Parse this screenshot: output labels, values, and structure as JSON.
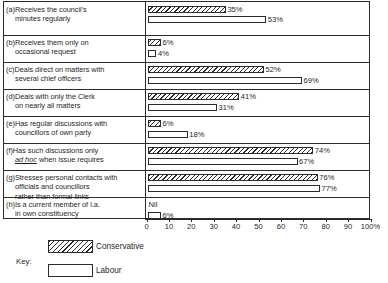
{
  "chart_data": {
    "type": "bar",
    "orientation": "horizontal",
    "title": "",
    "xlabel": "",
    "ylabel": "",
    "xlim": [
      0,
      100
    ],
    "grid": false,
    "legend_position": "bottom-left",
    "legend_title": "Key:",
    "axis_ticks": [
      {
        "value": 0,
        "label": "0"
      },
      {
        "value": 10,
        "label": "10"
      },
      {
        "value": 20,
        "label": "20"
      },
      {
        "value": 30,
        "label": "30"
      },
      {
        "value": 40,
        "label": "40"
      },
      {
        "value": 50,
        "label": "50"
      },
      {
        "value": 60,
        "label": "60"
      },
      {
        "value": 70,
        "label": "70"
      },
      {
        "value": 80,
        "label": "80"
      },
      {
        "value": 90,
        "label": "90"
      },
      {
        "value": 100,
        "label": "100%"
      }
    ],
    "series": [
      {
        "name": "Conservative",
        "pattern": "hatched",
        "values": [
          35,
          6,
          52,
          41,
          6,
          74,
          76,
          null
        ]
      },
      {
        "name": "Labour",
        "pattern": "open",
        "values": [
          53,
          4,
          69,
          31,
          18,
          67,
          77,
          6
        ]
      }
    ],
    "categories": [
      {
        "key": "a",
        "lines": [
          "(a)Receives the council's",
          "minutes regularly"
        ]
      },
      {
        "key": "b",
        "lines": [
          "(b)Receives them only on",
          "occasional request"
        ]
      },
      {
        "key": "c",
        "lines": [
          "(c)Deals direct on matters with",
          "several chief officers"
        ]
      },
      {
        "key": "d",
        "lines": [
          "(d)Deals with only the Clerk",
          "on nearly all matters"
        ]
      },
      {
        "key": "e",
        "lines": [
          "(e)Has regular discussions with",
          "councillors of own party"
        ]
      },
      {
        "key": "f",
        "lines": [
          "(f)Has such discussions only",
          "ad hoc when issue requires"
        ]
      },
      {
        "key": "g",
        "lines": [
          "(g)Stresses personal contacts with",
          "officials and councillors",
          "rather than formal links"
        ]
      },
      {
        "key": "h",
        "lines": [
          "(h)Is a current member of l.a.",
          "in own constituency"
        ]
      }
    ],
    "data_labels": {
      "conservative": [
        "35%",
        "6%",
        "52%",
        "41%",
        "6%",
        "74%",
        "76%",
        "Nil"
      ],
      "labour": [
        "53%",
        "4%",
        "69%",
        "31%",
        "18%",
        "67%",
        "77%",
        "6%"
      ]
    }
  },
  "rows": [
    {
      "label_lines": [
        "(a)Receives the council's",
        "minutes regularly"
      ],
      "con": {
        "value": 35,
        "label": "35%"
      },
      "lab": {
        "value": 53,
        "label": "53%"
      }
    },
    {
      "label_lines": [
        "(b)Receives them only on",
        "occasional request"
      ],
      "con": {
        "value": 6,
        "label": "6%"
      },
      "lab": {
        "value": 4,
        "label": "4%"
      }
    },
    {
      "label_lines": [
        "(c)Deals direct on matters with",
        "several chief officers"
      ],
      "con": {
        "value": 52,
        "label": "52%"
      },
      "lab": {
        "value": 69,
        "label": "69%"
      }
    },
    {
      "label_lines": [
        "(d)Deals with only the Clerk",
        "on nearly all matters"
      ],
      "con": {
        "value": 41,
        "label": "41%"
      },
      "lab": {
        "value": 31,
        "label": "31%"
      }
    },
    {
      "label_lines": [
        "(e)Has regular discussions with",
        "councillors of own party"
      ],
      "con": {
        "value": 6,
        "label": "6%"
      },
      "lab": {
        "value": 18,
        "label": "18%"
      }
    },
    {
      "label_lines": [
        "(f)Has such discussions only",
        "ad hoc when issue requires"
      ],
      "con": {
        "value": 74,
        "label": "74%"
      },
      "lab": {
        "value": 67,
        "label": "67%"
      }
    },
    {
      "label_lines": [
        "(g)Stresses personal contacts with",
        "officials and councillors",
        "rather than formal links"
      ],
      "con": {
        "value": 76,
        "label": "76%"
      },
      "lab": {
        "value": 77,
        "label": "77%"
      }
    },
    {
      "label_lines": [
        "(h)Is a current member of l.a.",
        "in own constituency"
      ],
      "con": {
        "value": 0,
        "label": "Nil"
      },
      "lab": {
        "value": 6,
        "label": "6%"
      }
    }
  ],
  "key": {
    "caption": "Key:",
    "items": [
      {
        "label": "Conservative",
        "pattern": "hatched"
      },
      {
        "label": "Labour",
        "pattern": "open"
      }
    ]
  },
  "colors": {
    "ink": "#2b2b2b",
    "paper": "#ffffff"
  }
}
